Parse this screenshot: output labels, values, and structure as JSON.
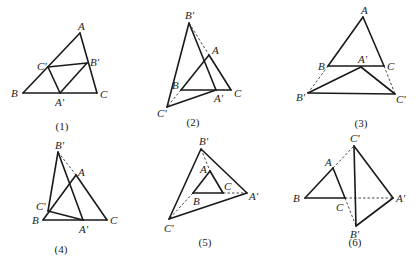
{
  "figures": [
    {
      "caption": "(1)",
      "caption_pos": [
        62,
        130
      ],
      "points": {
        "A": [
          80,
          33
        ],
        "B": [
          23,
          93
        ],
        "C": [
          97,
          93
        ],
        "A'": [
          60,
          93
        ],
        "B'": [
          87,
          63
        ],
        "C'": [
          48,
          67
        ]
      },
      "solid": [
        [
          "A",
          "B"
        ],
        [
          "B",
          "C"
        ],
        [
          "C",
          "A"
        ],
        [
          "A'",
          "B'"
        ],
        [
          "B'",
          "C'"
        ],
        [
          "C'",
          "A'"
        ]
      ],
      "dashed": [],
      "labels": [
        {
          "text": "A",
          "x": 78,
          "y": 30
        },
        {
          "text": "B",
          "x": 11,
          "y": 97
        },
        {
          "text": "C",
          "x": 100,
          "y": 98
        },
        {
          "text": "A'",
          "x": 55,
          "y": 106
        },
        {
          "text": "B'",
          "x": 90,
          "y": 66
        },
        {
          "text": "C'",
          "x": 37,
          "y": 70
        }
      ]
    },
    {
      "caption": "(2)",
      "caption_pos": [
        193,
        126
      ],
      "points": {
        "A": [
          209,
          55
        ],
        "B": [
          181,
          90
        ],
        "C": [
          231,
          90
        ],
        "A'": [
          216,
          90
        ],
        "B'": [
          189,
          23
        ],
        "C'": [
          167,
          107
        ]
      },
      "solid": [
        [
          "A",
          "B"
        ],
        [
          "B",
          "C"
        ],
        [
          "C",
          "A"
        ],
        [
          "A'",
          "B'"
        ],
        [
          "B'",
          "C'"
        ],
        [
          "C'",
          "A'"
        ]
      ],
      "dashed": [
        [
          "B'",
          "A"
        ],
        [
          "B",
          "C'"
        ]
      ],
      "labels": [
        {
          "text": "A",
          "x": 212,
          "y": 54
        },
        {
          "text": "B",
          "x": 172,
          "y": 89
        },
        {
          "text": "C",
          "x": 234,
          "y": 97
        },
        {
          "text": "A'",
          "x": 214,
          "y": 102
        },
        {
          "text": "B'",
          "x": 185,
          "y": 19
        },
        {
          "text": "C'",
          "x": 157,
          "y": 117
        }
      ]
    },
    {
      "caption": "(3)",
      "caption_pos": [
        361,
        127
      ],
      "points": {
        "A": [
          363,
          17
        ],
        "B": [
          328,
          66
        ],
        "C": [
          384,
          66
        ],
        "A'": [
          361,
          67
        ],
        "B'": [
          308,
          93
        ],
        "C'": [
          395,
          94
        ]
      },
      "solid": [
        [
          "A",
          "B"
        ],
        [
          "B",
          "C"
        ],
        [
          "C",
          "A"
        ],
        [
          "A'",
          "B'"
        ],
        [
          "B'",
          "C'"
        ],
        [
          "C'",
          "A'"
        ]
      ],
      "dashed": [
        [
          "B",
          "B'"
        ],
        [
          "C",
          "C'"
        ]
      ],
      "labels": [
        {
          "text": "A",
          "x": 361,
          "y": 14
        },
        {
          "text": "B",
          "x": 318,
          "y": 70
        },
        {
          "text": "C",
          "x": 387,
          "y": 70
        },
        {
          "text": "A'",
          "x": 358,
          "y": 63
        },
        {
          "text": "B'",
          "x": 296,
          "y": 101
        },
        {
          "text": "C'",
          "x": 396,
          "y": 103
        }
      ]
    },
    {
      "caption": "(4)",
      "caption_pos": [
        61,
        253
      ],
      "points": {
        "A": [
          76,
          175
        ],
        "B": [
          43,
          220
        ],
        "C": [
          107,
          220
        ],
        "A'": [
          83,
          220
        ],
        "B'": [
          58,
          152
        ],
        "C'": [
          48,
          211
        ]
      },
      "solid": [
        [
          "A",
          "B"
        ],
        [
          "B",
          "C"
        ],
        [
          "C",
          "A"
        ],
        [
          "A'",
          "B'"
        ],
        [
          "B'",
          "C'"
        ],
        [
          "C'",
          "A'"
        ]
      ],
      "dashed": [
        [
          "B'",
          "A"
        ]
      ],
      "labels": [
        {
          "text": "A",
          "x": 78,
          "y": 176
        },
        {
          "text": "B",
          "x": 32,
          "y": 224
        },
        {
          "text": "C",
          "x": 110,
          "y": 224
        },
        {
          "text": "A'",
          "x": 79,
          "y": 233
        },
        {
          "text": "B'",
          "x": 55,
          "y": 149
        },
        {
          "text": "C'",
          "x": 36,
          "y": 210
        }
      ]
    },
    {
      "caption": "(5)",
      "caption_pos": [
        205,
        246
      ],
      "points": {
        "A": [
          210,
          171
        ],
        "B": [
          193,
          193
        ],
        "C": [
          223,
          193
        ],
        "A'": [
          247,
          193
        ],
        "B'": [
          201,
          149
        ],
        "C'": [
          169,
          219
        ]
      },
      "solid": [
        [
          "A",
          "B"
        ],
        [
          "B",
          "C"
        ],
        [
          "C",
          "A"
        ],
        [
          "A'",
          "B'"
        ],
        [
          "B'",
          "C'"
        ],
        [
          "C'",
          "A'"
        ]
      ],
      "dashed": [
        [
          "B'",
          "A"
        ],
        [
          "C",
          "A'"
        ],
        [
          "B",
          "C'"
        ]
      ],
      "labels": [
        {
          "text": "A",
          "x": 200,
          "y": 173
        },
        {
          "text": "B",
          "x": 193,
          "y": 205
        },
        {
          "text": "C",
          "x": 224,
          "y": 190
        },
        {
          "text": "A'",
          "x": 249,
          "y": 200
        },
        {
          "text": "B'",
          "x": 199,
          "y": 145
        },
        {
          "text": "C'",
          "x": 164,
          "y": 232
        }
      ]
    },
    {
      "caption": "(6)",
      "caption_pos": [
        355,
        246
      ],
      "points": {
        "A": [
          333,
          168
        ],
        "B": [
          305,
          198
        ],
        "C": [
          345,
          198
        ],
        "A'": [
          393,
          198
        ],
        "B'": [
          356,
          226
        ],
        "C'": [
          354,
          146
        ]
      },
      "solid": [
        [
          "A",
          "B"
        ],
        [
          "B",
          "C"
        ],
        [
          "C",
          "A"
        ],
        [
          "A'",
          "B'"
        ],
        [
          "B'",
          "C'"
        ],
        [
          "C'",
          "A'"
        ]
      ],
      "dashed": [
        [
          "A",
          "C'"
        ],
        [
          "C",
          "A'"
        ],
        [
          "C",
          "B'"
        ]
      ],
      "labels": [
        {
          "text": "A",
          "x": 325,
          "y": 166
        },
        {
          "text": "B",
          "x": 293,
          "y": 202
        },
        {
          "text": "C",
          "x": 336,
          "y": 211
        },
        {
          "text": "A'",
          "x": 396,
          "y": 202
        },
        {
          "text": "B'",
          "x": 350,
          "y": 238
        },
        {
          "text": "C'",
          "x": 350,
          "y": 142
        }
      ]
    }
  ]
}
